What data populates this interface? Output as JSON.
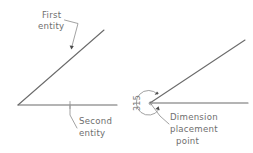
{
  "figure": {
    "background_color": "#ffffff",
    "line_color": "#6b6b6b",
    "leader_color": "#8a8a8a",
    "text_color": "#6e6e6e",
    "arrow_color": "#4a4a4a"
  },
  "left_diagram": {
    "name": "entity-selection-diagram",
    "labels": {
      "first_entity_line1": "First",
      "first_entity_line2": "entity",
      "second_entity_line1": "Second",
      "second_entity_line2": "entity"
    }
  },
  "right_diagram": {
    "name": "dimension-placement-diagram",
    "dimension_value": "315",
    "labels": {
      "placement_line1": "Dimension",
      "placement_line2": "placement",
      "placement_line3": "point"
    }
  }
}
